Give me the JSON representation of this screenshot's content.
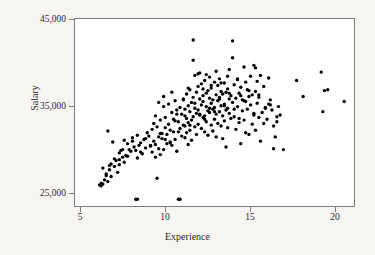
{
  "chart_data": {
    "type": "scatter",
    "title": "",
    "xlabel": "Experience",
    "ylabel": "Salary",
    "xlim": [
      4.3,
      21.3
    ],
    "ylim": [
      23400,
      45600
    ],
    "xticks": [
      5,
      10,
      15,
      20
    ],
    "xtick_labels": [
      "5",
      "10",
      "15",
      "20"
    ],
    "yticks": [
      25000,
      35000,
      45000
    ],
    "ytick_labels": [
      "25,000",
      "35,000",
      "45,000"
    ],
    "grid": false,
    "legend": null,
    "marker": {
      "shape": "circle",
      "color": "#000000",
      "size_px": 3.4
    },
    "n_points": 281,
    "x": [
      5.8,
      5.9,
      5.9,
      6.0,
      6.1,
      6.2,
      6.3,
      6.3,
      6.4,
      6.5,
      6.5,
      6.6,
      6.7,
      6.8,
      6.9,
      7.0,
      7.0,
      7.1,
      7.2,
      7.3,
      7.3,
      7.4,
      7.5,
      7.6,
      7.7,
      7.8,
      7.9,
      8.0,
      8.1,
      8.1,
      8.2,
      8.3,
      8.4,
      8.5,
      8.6,
      8.7,
      8.8,
      8.9,
      9.0,
      9.0,
      9.1,
      9.1,
      9.2,
      9.2,
      9.3,
      9.3,
      9.4,
      9.4,
      9.5,
      9.5,
      9.6,
      9.6,
      9.7,
      9.7,
      9.8,
      9.8,
      9.9,
      9.9,
      10.0,
      10.0,
      10.1,
      10.1,
      10.2,
      10.2,
      10.3,
      10.3,
      10.4,
      10.4,
      10.5,
      10.5,
      10.6,
      10.6,
      10.7,
      10.7,
      10.8,
      10.8,
      10.9,
      10.9,
      11.0,
      11.0,
      11.0,
      11.1,
      11.1,
      11.1,
      11.2,
      11.2,
      11.2,
      11.3,
      11.3,
      11.3,
      11.4,
      11.4,
      11.4,
      11.5,
      11.5,
      11.5,
      11.6,
      11.6,
      11.6,
      11.7,
      11.7,
      11.7,
      11.8,
      11.8,
      11.8,
      11.9,
      11.9,
      11.9,
      12.0,
      12.0,
      12.0,
      12.1,
      12.1,
      12.1,
      12.2,
      12.2,
      12.2,
      12.3,
      12.3,
      12.3,
      12.4,
      12.4,
      12.4,
      12.5,
      12.5,
      12.5,
      12.6,
      12.6,
      12.6,
      12.7,
      12.7,
      12.7,
      12.8,
      12.8,
      12.8,
      12.9,
      12.9,
      12.9,
      13.0,
      13.0,
      13.0,
      13.1,
      13.1,
      13.1,
      13.2,
      13.2,
      13.2,
      13.3,
      13.3,
      13.3,
      13.4,
      13.4,
      13.4,
      13.5,
      13.5,
      13.5,
      13.6,
      13.6,
      13.6,
      13.7,
      13.7,
      13.7,
      13.8,
      13.8,
      13.9,
      13.9,
      14.0,
      14.0,
      14.1,
      14.1,
      14.2,
      14.2,
      14.3,
      14.3,
      14.4,
      14.4,
      14.5,
      14.5,
      14.6,
      14.6,
      14.7,
      14.7,
      14.8,
      14.8,
      14.9,
      14.9,
      15.0,
      15.0,
      15.1,
      15.1,
      15.2,
      15.2,
      15.3,
      15.3,
      15.4,
      15.4,
      15.5,
      15.5,
      15.6,
      15.7,
      15.8,
      15.9,
      16.0,
      16.1,
      16.2,
      16.3,
      16.4,
      16.5,
      16.6,
      16.7,
      10.7,
      8.1,
      6.0,
      6.2,
      6.4,
      6.7,
      7.0,
      7.2,
      7.5,
      7.8,
      8.0,
      8.3,
      8.6,
      8.9,
      9.2,
      9.5,
      9.8,
      10.1,
      10.4,
      10.6,
      11.0,
      11.3,
      11.6,
      11.9,
      12.2,
      12.5,
      12.8,
      13.1,
      13.4,
      13.7,
      14.0,
      14.3,
      14.6,
      14.9,
      15.2,
      15.5,
      15.8,
      16.1,
      16.4,
      16.6,
      17.8,
      18.2,
      19.3,
      19.4,
      19.7,
      19.5,
      20.7,
      17.0,
      16.8,
      15.9,
      11.5,
      13.9,
      12.3,
      14.7,
      10.2,
      9.4,
      12.9,
      13.6,
      11.2,
      10.9,
      15.3,
      14.2,
      12.6,
      11.8,
      13.2,
      9.7,
      10.5,
      12.1,
      14.4,
      15.6,
      16.2
    ],
    "y": [
      25900,
      26100,
      25800,
      27900,
      26500,
      27200,
      26300,
      32300,
      27700,
      28400,
      26900,
      31000,
      28100,
      28800,
      27400,
      29700,
      28300,
      30000,
      29200,
      28600,
      31200,
      29400,
      30800,
      30100,
      29900,
      31500,
      30400,
      24200,
      29100,
      31800,
      30600,
      30900,
      29600,
      31300,
      30300,
      32100,
      31700,
      30500,
      29800,
      32500,
      31100,
      33200,
      30700,
      34100,
      26700,
      32800,
      31600,
      30200,
      29500,
      33600,
      32000,
      31400,
      36400,
      30100,
      33900,
      32700,
      31900,
      30800,
      33100,
      35500,
      32400,
      31000,
      34500,
      30600,
      33700,
      32200,
      35900,
      31300,
      34800,
      29900,
      24200,
      33400,
      32600,
      35100,
      31700,
      34300,
      33000,
      36000,
      32900,
      34900,
      31500,
      33800,
      36700,
      32100,
      35300,
      33300,
      30700,
      34600,
      37200,
      32400,
      35700,
      33600,
      31200,
      43100,
      36300,
      34000,
      38900,
      35000,
      32800,
      36900,
      34400,
      31900,
      37600,
      34800,
      33100,
      36100,
      39200,
      34200,
      35400,
      32600,
      37900,
      36500,
      33900,
      35800,
      34100,
      38300,
      32200,
      36800,
      35200,
      33400,
      37100,
      34700,
      31800,
      36200,
      38700,
      34500,
      35600,
      33000,
      37400,
      36000,
      34900,
      32300,
      38100,
      35100,
      33700,
      36600,
      34300,
      31600,
      37700,
      35900,
      33200,
      36300,
      34600,
      38500,
      35300,
      32900,
      37000,
      36700,
      34100,
      31400,
      38000,
      35500,
      33500,
      36900,
      34800,
      30400,
      37300,
      35000,
      32700,
      36100,
      39600,
      34400,
      36500,
      33800,
      43000,
      35700,
      37800,
      34000,
      36200,
      32500,
      38400,
      35200,
      33300,
      36800,
      30800,
      37500,
      34700,
      36000,
      33600,
      39900,
      35800,
      32100,
      37200,
      34900,
      36400,
      31900,
      38800,
      35400,
      33100,
      36600,
      40100,
      34200,
      37000,
      32400,
      35600,
      38200,
      33900,
      36300,
      31100,
      34500,
      37600,
      35100,
      33700,
      38600,
      36000,
      34800,
      30200,
      31600,
      33400,
      35200,
      24200,
      24200,
      26000,
      27000,
      28200,
      29000,
      28900,
      30100,
      29300,
      31100,
      30000,
      29800,
      31400,
      30600,
      29200,
      32000,
      31300,
      30900,
      33500,
      32200,
      34100,
      33000,
      35600,
      34300,
      33700,
      35000,
      34600,
      36100,
      35300,
      36800,
      34900,
      33800,
      35900,
      37100,
      34400,
      36600,
      33200,
      35500,
      32900,
      34000,
      38300,
      36400,
      39300,
      34600,
      37200,
      37100,
      35800,
      30100,
      34200,
      35000,
      40700,
      41000,
      39000,
      38100,
      36900,
      35700,
      39400,
      38800,
      37400,
      36100,
      39800,
      38500,
      37700,
      39100,
      38000,
      35200,
      34300,
      37300,
      36500,
      38900,
      35400
    ]
  },
  "axes": {
    "ylabel_text": "Salary",
    "xlabel_text": "Experience",
    "y_tick_labels": [
      "45,000",
      "35,000",
      "25,000"
    ],
    "x_tick_labels": [
      "5",
      "10",
      "15",
      "20"
    ]
  },
  "style": {
    "page_background": "#f6f5f2",
    "plot_background": "#ffffff",
    "frame_color": "#7d7d7d",
    "marker_color": "#000000",
    "text_color": "#2b2b2b"
  }
}
